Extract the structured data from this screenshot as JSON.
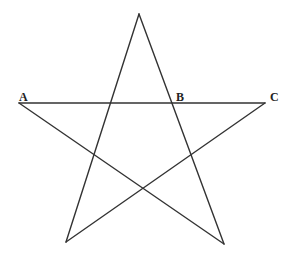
{
  "diagram": {
    "type": "pentagram",
    "stroke_color": "#333333",
    "stroke_width": 1.4,
    "vertices": {
      "top": [
        139,
        14
      ],
      "left": [
        19,
        103
      ],
      "right": [
        265,
        103
      ],
      "bottom_left": [
        66,
        242
      ],
      "bottom_right": [
        224,
        244
      ]
    },
    "segments": [
      {
        "from": "top",
        "to": "bottom_left"
      },
      {
        "from": "top",
        "to": "bottom_right"
      },
      {
        "from": "left",
        "to": "right"
      },
      {
        "from": "left",
        "to": "bottom_right"
      },
      {
        "from": "right",
        "to": "bottom_left"
      }
    ],
    "labels": [
      {
        "text": "A",
        "x": 19,
        "y": 91
      },
      {
        "text": "B",
        "x": 176,
        "y": 91
      },
      {
        "text": "C",
        "x": 270,
        "y": 91
      }
    ]
  }
}
